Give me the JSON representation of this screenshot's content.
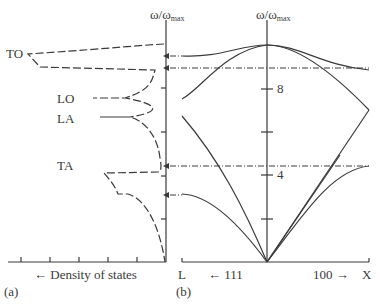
{
  "panel_a": {
    "tag": "(a)",
    "axis_title": "ω/ω",
    "axis_title_sub": "max",
    "x_label": "← Density of states",
    "branch_labels": [
      "TO",
      "LO",
      "LA",
      "TA"
    ]
  },
  "panel_b": {
    "tag": "(b)",
    "axis_title": "ω/ω",
    "axis_title_sub": "max",
    "y_tick_labels": [
      "8",
      "4"
    ],
    "x_left_label": "L",
    "x_right_label": "X",
    "dir_left_label": "← 111",
    "dir_right_label": "100 →"
  },
  "colors": {
    "line": "#3a3a3a",
    "background": "#ffffff"
  }
}
